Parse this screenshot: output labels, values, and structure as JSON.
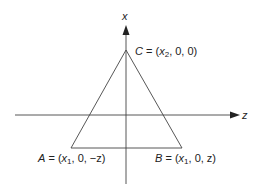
{
  "axes": {
    "vertical_label": "x",
    "horizontal_label": "z"
  },
  "points": {
    "A": {
      "name": "A",
      "coords_prefix": "= (",
      "var": "x",
      "sub": "1",
      "rest": ", 0, −z)"
    },
    "B": {
      "name": "B",
      "coords_prefix": "= (",
      "var": "x",
      "sub": "1",
      "rest": ", 0, z)"
    },
    "C": {
      "name": "C",
      "coords_prefix": "= (",
      "var": "x",
      "sub": "2",
      "rest": ", 0, 0)"
    }
  },
  "colors": {
    "line": "#333333",
    "text": "#222222"
  }
}
